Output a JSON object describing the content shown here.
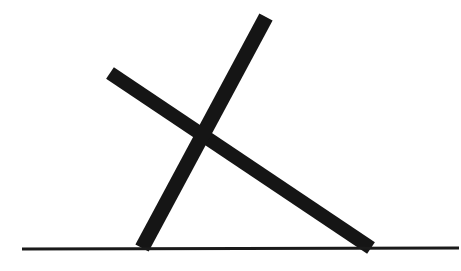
{
  "scene": {
    "title": "Two crossed sticks leaning on a ground line",
    "width": 461,
    "height": 271,
    "background_color": "#ffffff",
    "ink_color": "#151515",
    "ground_color": "#1a1a1a"
  },
  "ground_line": {
    "label": "ground-line",
    "x1": 22,
    "y1": 249,
    "x2": 459,
    "y2": 248,
    "thickness": 3,
    "color": "#1a1a1a"
  },
  "sticks": [
    {
      "label": "long-shallow-stick",
      "description": "Long bar from upper-left down to lower-right, resting its right tip on the ground line",
      "x1": 110,
      "y1": 73,
      "x2": 371,
      "y2": 248,
      "thickness": 14,
      "color": "#151515",
      "angle_degrees": 33.8
    },
    {
      "label": "steep-stick",
      "description": "Steeper bar from the top of the frame down to the lower-left, resting its bottom tip on the ground line",
      "x1": 266,
      "y1": 17,
      "x2": 142,
      "y2": 248,
      "thickness": 15,
      "color": "#151515",
      "angle_degrees": 61.8
    }
  ],
  "crossing_point": {
    "label": "crossing-point",
    "x": 202,
    "y": 136
  }
}
